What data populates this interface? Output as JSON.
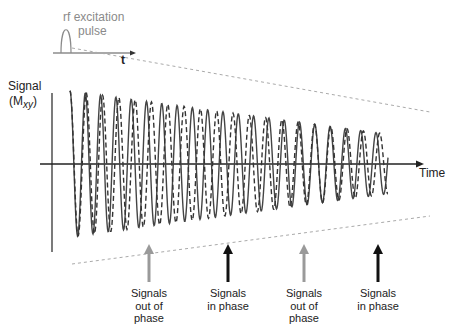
{
  "inset": {
    "pulse_label_line1": "rf excitation",
    "pulse_label_line2": "pulse",
    "axis_label": "t"
  },
  "main_plot": {
    "y_axis_label_line1": "Signal",
    "y_axis_label_line2_prefix": "(M",
    "y_axis_label_subscript": "xy",
    "y_axis_label_line2_suffix": ")",
    "x_axis_label": "Time"
  },
  "annotations": [
    {
      "line1": "Signals",
      "line2": "out of",
      "line3": "phase",
      "color": "#9a9a9a"
    },
    {
      "line1": "Signals",
      "line2": "in phase",
      "line3": "",
      "color": "#111111"
    },
    {
      "line1": "Signals",
      "line2": "out of",
      "line3": "phase",
      "color": "#9a9a9a"
    },
    {
      "line1": "Signals",
      "line2": "in phase",
      "line3": "",
      "color": "#111111"
    }
  ],
  "colors": {
    "solid_wave": "#444444",
    "dashed_wave": "#333333",
    "envelope": "#aaaaaa",
    "axis": "#222222",
    "out_of_phase_arrow": "#9a9a9a",
    "in_phase_arrow": "#111111"
  }
}
